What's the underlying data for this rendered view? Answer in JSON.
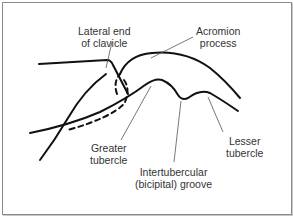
{
  "figure": {
    "type": "anatomical line diagram",
    "labels": [
      {
        "id": "lateral_end_of_clavicle",
        "line1": "Lateral end",
        "line2": "of clavicle"
      },
      {
        "id": "acromion_process",
        "line1": "Acromion",
        "line2": "process"
      },
      {
        "id": "greater_tubercle",
        "line1": "Greater",
        "line2": "tubercle"
      },
      {
        "id": "intertubercular_groove",
        "line1": "Intertubercular",
        "line2": "(bicipital) groove"
      },
      {
        "id": "lesser_tubercle",
        "line1": "Lesser",
        "line2": "tubercle"
      }
    ],
    "colors": {
      "stroke": "#111111",
      "leader": "#555555",
      "text": "#333333",
      "border": "#8a8a8a"
    }
  }
}
